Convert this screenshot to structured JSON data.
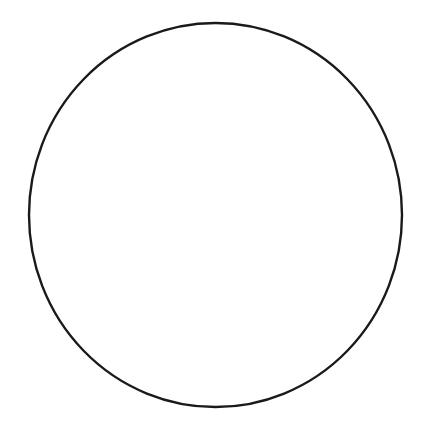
{
  "figure": {
    "name": "fraction-circle",
    "title": "Fraction circle divided into twelve equal sectors",
    "background_color": "#ffffff",
    "stroke_color": "#1a1a1a",
    "fill_color": "#ffffff",
    "outline_stroke_width": 2.4,
    "divider_stroke_width": 2.2,
    "center_x": 215.5,
    "center_y": 215,
    "radius_x": 186.5,
    "radius_y": 192,
    "sector_count": 12,
    "sector_angle_degrees": 30,
    "start_angle_offset_degrees": 15,
    "labels": []
  },
  "chart_data": {
    "type": "pie",
    "title": "",
    "subtitle": "",
    "xlabel": "",
    "ylabel": "",
    "legend": [],
    "annotations": [],
    "grid": false,
    "categories": [
      "1/12",
      "1/12",
      "1/12",
      "1/12",
      "1/12",
      "1/12",
      "1/12",
      "1/12",
      "1/12",
      "1/12",
      "1/12",
      "1/12"
    ],
    "values": [
      8.3333,
      8.3333,
      8.3333,
      8.3333,
      8.3333,
      8.3333,
      8.3333,
      8.3333,
      8.3333,
      8.3333,
      8.3333,
      8.3333
    ],
    "slice_angles_degrees": [
      30,
      30,
      30,
      30,
      30,
      30,
      30,
      30,
      30,
      30,
      30,
      30
    ],
    "divider_angles_degrees": [
      15,
      45,
      75,
      105,
      135,
      165,
      195,
      225,
      255,
      285,
      315,
      345
    ],
    "slice_colors": [
      "#ffffff",
      "#ffffff",
      "#ffffff",
      "#ffffff",
      "#ffffff",
      "#ffffff",
      "#ffffff",
      "#ffffff",
      "#ffffff",
      "#ffffff",
      "#ffffff",
      "#ffffff"
    ],
    "total": 100,
    "units": "percent"
  }
}
